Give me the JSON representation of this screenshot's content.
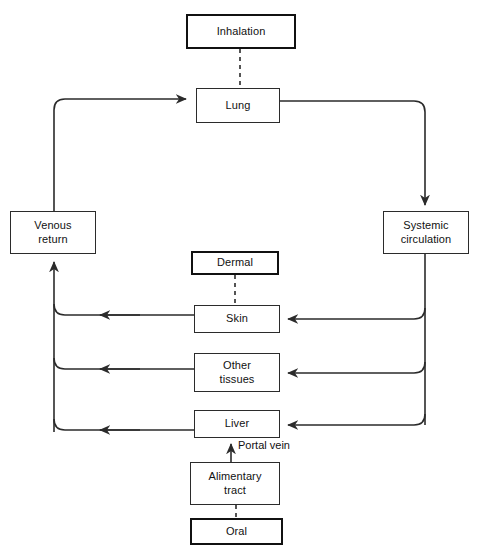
{
  "diagram": {
    "background_color": "#ffffff",
    "line_color": "#2b2b2b",
    "text_color": "#111111",
    "nodes": {
      "inhalation": {
        "label": "Inhalation",
        "type": "route",
        "x": 186,
        "y": 14,
        "w": 110,
        "h": 35
      },
      "lung": {
        "label": "Lung",
        "type": "organ",
        "x": 196,
        "y": 88,
        "w": 84,
        "h": 35
      },
      "venous_return": {
        "label": "Venous\nreturn",
        "type": "compartment",
        "x": 10,
        "y": 211,
        "w": 86,
        "h": 43
      },
      "systemic_circulation": {
        "label": "Systemic\ncirculation",
        "type": "compartment",
        "x": 383,
        "y": 211,
        "w": 86,
        "h": 43
      },
      "dermal": {
        "label": "Dermal",
        "type": "route",
        "x": 191,
        "y": 251,
        "w": 88,
        "h": 24
      },
      "skin": {
        "label": "Skin",
        "type": "organ",
        "x": 194,
        "y": 305,
        "w": 86,
        "h": 28
      },
      "other_tissues": {
        "label": "Other\ntissues",
        "type": "organ",
        "x": 194,
        "y": 353,
        "w": 86,
        "h": 39
      },
      "liver": {
        "label": "Liver",
        "type": "organ",
        "x": 194,
        "y": 410,
        "w": 86,
        "h": 28
      },
      "alimentary_tract": {
        "label": "Alimentary\ntract",
        "type": "organ",
        "x": 190,
        "y": 462,
        "w": 90,
        "h": 43
      },
      "oral": {
        "label": "Oral",
        "type": "route",
        "x": 190,
        "y": 518,
        "w": 93,
        "h": 27
      }
    },
    "edge_labels": {
      "portal_vein": {
        "text": "Portal vein",
        "x": 238,
        "y": 440
      }
    }
  }
}
